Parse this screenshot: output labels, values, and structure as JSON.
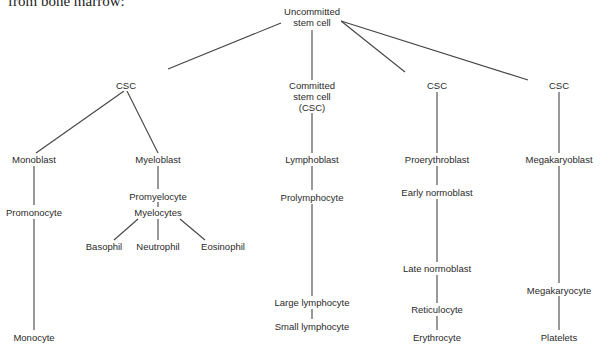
{
  "caption": "from bone marrow:",
  "nodes": {
    "uncommitted": "Uncommitted\nstem cell",
    "csc_left": "CSC",
    "committed": "Committed\nstem cell\n(CSC)",
    "csc_mid": "CSC",
    "csc_right": "CSC",
    "monoblast": "Monoblast",
    "promonocyte": "Promonocyte",
    "monocyte": "Monocyte",
    "myeloblast": "Myeloblast",
    "promyelocyte": "Promyelocyte",
    "myelocytes": "Myelocytes",
    "basophil": "Basophil",
    "neutrophil": "Neutrophil",
    "eosinophil": "Eosinophil",
    "lymphoblast": "Lymphoblast",
    "prolymphocyte": "Prolymphocyte",
    "large_lymphocyte": "Large lymphocyte",
    "small_lymphocyte": "Small lymphocyte",
    "proerythroblast": "Proerythroblast",
    "early_normoblast": "Early normoblast",
    "late_normoblast": "Late normoblast",
    "reticulocyte": "Reticulocyte",
    "erythrocyte": "Erythrocyte",
    "megakaryoblast": "Megakaryoblast",
    "megakaryocyte": "Megakaryocyte",
    "platelets": "Platelets"
  }
}
